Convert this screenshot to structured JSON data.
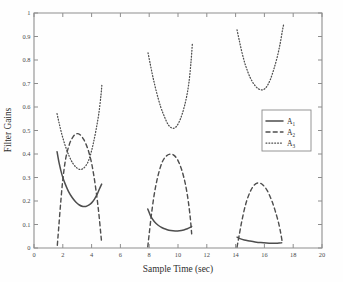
{
  "chart_data": {
    "type": "line",
    "title": "",
    "xlabel": "Sample Time (sec)",
    "ylabel": "Filter Gains",
    "xlim": [
      0,
      20
    ],
    "ylim": [
      0,
      1
    ],
    "xticks": [
      0,
      2,
      4,
      6,
      8,
      10,
      12,
      14,
      16,
      18,
      20
    ],
    "xticklabels": [
      "0",
      "2",
      "4",
      "6",
      "8",
      "10",
      "12",
      "14",
      "16",
      "18",
      "20"
    ],
    "yticks": [
      0,
      0.1,
      0.2,
      0.3,
      0.4,
      0.5,
      0.6,
      0.7,
      0.8,
      0.9,
      1
    ],
    "yticklabels": [
      "0",
      "0.1",
      "0.2",
      "0.3",
      "0.4",
      "0.5",
      "0.6",
      "0.7",
      "0.8",
      "0.9",
      "1"
    ],
    "grid": false,
    "legend_position": "upper right",
    "line_color": "#4d4d4d",
    "legend": [
      {
        "label": "A",
        "sub": "1",
        "style": "solid"
      },
      {
        "label": "A",
        "sub": "2",
        "style": "dashed"
      },
      {
        "label": "A",
        "sub": "3",
        "style": "dotted"
      }
    ],
    "series": [
      {
        "name": "A1",
        "style": "solid",
        "segments": [
          {
            "x": [
              1.6,
              1.75,
              1.95,
              2.15,
              2.4,
              2.65,
              2.9,
              3.15,
              3.4,
              3.6,
              3.8,
              4.0,
              4.2,
              4.4,
              4.55,
              4.7
            ],
            "y": [
              0.41,
              0.36,
              0.31,
              0.275,
              0.24,
              0.215,
              0.196,
              0.183,
              0.177,
              0.177,
              0.182,
              0.192,
              0.208,
              0.23,
              0.252,
              0.272
            ]
          },
          {
            "x": [
              7.9,
              8.1,
              8.35,
              8.6,
              8.9,
              9.2,
              9.5,
              9.8,
              10.1,
              10.4,
              10.65,
              10.85,
              10.95
            ],
            "y": [
              0.166,
              0.136,
              0.113,
              0.098,
              0.086,
              0.079,
              0.074,
              0.072,
              0.073,
              0.077,
              0.082,
              0.088,
              0.092
            ]
          },
          {
            "x": [
              14.1,
              14.3,
              14.6,
              14.95,
              15.35,
              15.75,
              16.15,
              16.5,
              16.8,
              17.05,
              17.2
            ],
            "y": [
              0.046,
              0.04,
              0.034,
              0.03,
              0.026,
              0.023,
              0.021,
              0.02,
              0.02,
              0.021,
              0.022
            ]
          }
        ]
      },
      {
        "name": "A2",
        "style": "dashed",
        "segments": [
          {
            "x": [
              1.62,
              1.72,
              1.85,
              2.0,
              2.2,
              2.45,
              2.7,
              2.95,
              3.2,
              3.45,
              3.7,
              3.95,
              4.15,
              4.35,
              4.5,
              4.62,
              4.7
            ],
            "y": [
              0.012,
              0.09,
              0.19,
              0.29,
              0.38,
              0.44,
              0.472,
              0.486,
              0.482,
              0.462,
              0.428,
              0.375,
              0.31,
              0.225,
              0.148,
              0.072,
              0.022
            ]
          },
          {
            "x": [
              7.9,
              8.0,
              8.15,
              8.35,
              8.6,
              8.9,
              9.2,
              9.5,
              9.75,
              10.0,
              10.25,
              10.5,
              10.7,
              10.85,
              10.95
            ],
            "y": [
              0.005,
              0.06,
              0.14,
              0.228,
              0.305,
              0.365,
              0.392,
              0.4,
              0.393,
              0.372,
              0.334,
              0.276,
              0.205,
              0.13,
              0.06
            ]
          },
          {
            "x": [
              14.1,
              14.25,
              14.45,
              14.7,
              15.0,
              15.3,
              15.6,
              15.9,
              16.2,
              16.5,
              16.75,
              17.0,
              17.15,
              17.25
            ],
            "y": [
              0.004,
              0.055,
              0.12,
              0.186,
              0.238,
              0.268,
              0.277,
              0.268,
              0.244,
              0.203,
              0.158,
              0.103,
              0.058,
              0.022
            ]
          }
        ]
      },
      {
        "name": "A3",
        "style": "dotted",
        "segments": [
          {
            "x": [
              1.6,
              1.75,
              1.95,
              2.2,
              2.45,
              2.7,
              2.95,
              3.2,
              3.45,
              3.7,
              3.9,
              4.1,
              4.3,
              4.5,
              4.65,
              4.72
            ],
            "y": [
              0.572,
              0.53,
              0.48,
              0.43,
              0.39,
              0.36,
              0.342,
              0.334,
              0.34,
              0.36,
              0.392,
              0.44,
              0.5,
              0.572,
              0.65,
              0.7
            ]
          },
          {
            "x": [
              7.92,
              8.05,
              8.25,
              8.5,
              8.8,
              9.05,
              9.3,
              9.55,
              9.8,
              10.05,
              10.3,
              10.55,
              10.75,
              10.9,
              11.0
            ],
            "y": [
              0.83,
              0.79,
              0.73,
              0.665,
              0.6,
              0.56,
              0.527,
              0.511,
              0.512,
              0.533,
              0.572,
              0.63,
              0.7,
              0.79,
              0.872
            ]
          },
          {
            "x": [
              14.1,
              14.25,
              14.45,
              14.7,
              15.0,
              15.3,
              15.6,
              15.9,
              16.15,
              16.4,
              16.65,
              16.9,
              17.1,
              17.25,
              17.35
            ],
            "y": [
              0.928,
              0.885,
              0.83,
              0.775,
              0.727,
              0.695,
              0.677,
              0.673,
              0.686,
              0.715,
              0.76,
              0.815,
              0.872,
              0.925,
              0.955
            ]
          }
        ]
      }
    ]
  },
  "axes": {
    "xlabel_text": "Sample Time (sec)",
    "ylabel_text": "Filter Gains"
  }
}
